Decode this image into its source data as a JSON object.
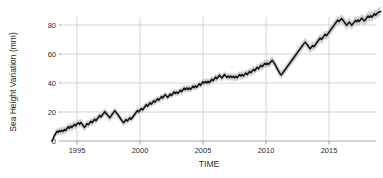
{
  "chart_data": {
    "type": "line",
    "title": "",
    "xlabel": "TIME",
    "ylabel": "Sea Height Variation (mm)",
    "xlim": [
      1992.6,
      11992.6
    ],
    "ylim": [
      -4,
      92
    ],
    "grid": true,
    "legend": false,
    "xticks": [
      1995,
      2000,
      2005,
      2010,
      2015
    ],
    "xtick_labels": [
      "1995",
      "2000",
      "2005",
      "2010",
      "2015"
    ],
    "yticks": [
      0,
      20,
      40,
      60,
      80
    ],
    "ytick_labels": [
      "0",
      "20",
      "40",
      "60",
      "80"
    ],
    "series": [
      {
        "name": "Sea Height Variation",
        "color": "#141414",
        "band_color": "#c9c9c9",
        "x": [
          1993.0,
          1993.1,
          1993.2,
          1993.3,
          1993.4,
          1993.5,
          1993.6,
          1993.7,
          1993.8,
          1993.9,
          1994.0,
          1994.1,
          1994.2,
          1994.3,
          1994.4,
          1994.5,
          1994.6,
          1994.7,
          1994.8,
          1994.9,
          1995.0,
          1995.1,
          1995.2,
          1995.3,
          1995.4,
          1995.5,
          1995.6,
          1995.7,
          1995.8,
          1995.9,
          1996.0,
          1996.1,
          1996.2,
          1996.3,
          1996.4,
          1996.5,
          1996.6,
          1996.7,
          1996.8,
          1996.9,
          1997.0,
          1997.1,
          1997.2,
          1997.3,
          1997.4,
          1997.5,
          1997.6,
          1997.7,
          1997.8,
          1997.9,
          1998.0,
          1998.1,
          1998.2,
          1998.3,
          1998.4,
          1998.5,
          1998.6,
          1998.7,
          1998.8,
          1998.9,
          1999.0,
          1999.1,
          1999.2,
          1999.3,
          1999.4,
          1999.5,
          1999.6,
          1999.7,
          1999.8,
          1999.9,
          2000.0,
          2000.1,
          2000.2,
          2000.3,
          2000.4,
          2000.5,
          2000.6,
          2000.7,
          2000.8,
          2000.9,
          2001.0,
          2001.1,
          2001.2,
          2001.3,
          2001.4,
          2001.5,
          2001.6,
          2001.7,
          2001.8,
          2001.9,
          2002.0,
          2002.1,
          2002.2,
          2002.3,
          2002.4,
          2002.5,
          2002.6,
          2002.7,
          2002.8,
          2002.9,
          2003.0,
          2003.1,
          2003.2,
          2003.3,
          2003.4,
          2003.5,
          2003.6,
          2003.7,
          2003.8,
          2003.9,
          2004.0,
          2004.1,
          2004.2,
          2004.3,
          2004.4,
          2004.5,
          2004.6,
          2004.7,
          2004.8,
          2004.9,
          2005.0,
          2005.1,
          2005.2,
          2005.3,
          2005.4,
          2005.5,
          2005.6,
          2005.7,
          2005.8,
          2005.9,
          2006.0,
          2006.1,
          2006.2,
          2006.3,
          2006.4,
          2006.5,
          2006.6,
          2006.7,
          2006.8,
          2006.9,
          2007.0,
          2007.1,
          2007.2,
          2007.3,
          2007.4,
          2007.5,
          2007.6,
          2007.7,
          2007.8,
          2007.9,
          2008.0,
          2008.1,
          2008.2,
          2008.3,
          2008.4,
          2008.5,
          2008.6,
          2008.7,
          2008.8,
          2008.9,
          2009.0,
          2009.1,
          2009.2,
          2009.3,
          2009.4,
          2009.5,
          2009.6,
          2009.7,
          2009.8,
          2009.9,
          2010.0,
          2010.1,
          2010.2,
          2010.3,
          2010.4,
          2010.5,
          2010.6,
          2010.7,
          2010.8,
          2010.9,
          2011.0,
          2011.1,
          2011.2,
          2011.3,
          2011.4,
          2011.5,
          2011.6,
          2011.7,
          2011.8,
          2011.9,
          2012.0,
          2012.1,
          2012.2,
          2012.3,
          2012.4,
          2012.5,
          2012.6,
          2012.7,
          2012.8,
          2012.9,
          2013.0,
          2013.1,
          2013.2,
          2013.3,
          2013.4,
          2013.5,
          2013.6,
          2013.7,
          2013.8,
          2013.9,
          2014.0,
          2014.1,
          2014.2,
          2014.3,
          2014.4,
          2014.5,
          2014.6,
          2014.7,
          2014.8,
          2014.9,
          2015.0,
          2015.1,
          2015.2,
          2015.3,
          2015.4,
          2015.5,
          2015.6,
          2015.7,
          2015.8,
          2015.9,
          2016.0,
          2016.1,
          2016.2,
          2016.3,
          2016.4,
          2016.5,
          2016.6,
          2016.7,
          2016.8,
          2016.9,
          2017.0,
          2017.1,
          2017.2,
          2017.3,
          2017.4,
          2017.5,
          2017.6,
          2017.7,
          2017.8,
          2017.9,
          2018.0,
          2018.1,
          2018.2,
          2018.3,
          2018.4,
          2018.5,
          2018.6,
          2018.7,
          2018.8,
          2018.9,
          2019.0,
          2019.1
        ],
        "y": [
          0.0,
          1.5,
          3.6,
          5.0,
          6.6,
          6.0,
          7.2,
          6.4,
          7.4,
          6.6,
          8.0,
          7.2,
          8.4,
          9.8,
          8.8,
          10.2,
          9.4,
          10.6,
          11.4,
          10.4,
          11.8,
          12.6,
          11.6,
          12.8,
          11.8,
          10.4,
          9.4,
          10.6,
          12.0,
          11.2,
          12.4,
          13.6,
          12.6,
          13.8,
          15.0,
          14.0,
          15.2,
          16.4,
          17.6,
          16.6,
          17.8,
          19.0,
          20.2,
          19.2,
          18.2,
          17.0,
          16.0,
          17.2,
          18.4,
          19.6,
          20.8,
          19.8,
          18.6,
          17.4,
          16.2,
          14.8,
          13.6,
          12.6,
          13.8,
          14.8,
          13.8,
          14.8,
          16.0,
          15.0,
          16.2,
          17.4,
          18.6,
          19.8,
          21.0,
          20.0,
          21.2,
          22.4,
          21.4,
          22.6,
          23.8,
          25.0,
          24.0,
          25.2,
          26.4,
          25.4,
          26.6,
          27.8,
          26.8,
          28.0,
          29.2,
          28.2,
          29.4,
          30.6,
          29.6,
          30.8,
          32.0,
          31.0,
          30.0,
          31.2,
          32.4,
          31.4,
          32.6,
          33.8,
          32.8,
          33.8,
          32.8,
          33.8,
          35.0,
          34.0,
          35.2,
          36.4,
          35.4,
          36.6,
          35.6,
          36.6,
          35.6,
          36.6,
          37.8,
          36.8,
          38.0,
          37.0,
          38.2,
          39.4,
          38.4,
          39.6,
          40.8,
          40.0,
          41.0,
          40.0,
          41.2,
          40.2,
          41.4,
          42.6,
          41.6,
          42.8,
          44.0,
          43.0,
          44.2,
          45.4,
          44.4,
          43.4,
          44.6,
          45.8,
          44.8,
          43.8,
          44.8,
          43.8,
          44.8,
          43.8,
          44.6,
          43.6,
          44.6,
          43.6,
          44.6,
          45.8,
          44.8,
          45.8,
          44.8,
          45.8,
          46.8,
          45.8,
          46.8,
          48.0,
          47.0,
          48.2,
          49.4,
          48.4,
          49.6,
          50.8,
          49.8,
          51.0,
          52.2,
          51.2,
          52.4,
          53.6,
          52.6,
          53.8,
          52.8,
          53.8,
          54.8,
          55.6,
          54.4,
          53.0,
          51.4,
          49.8,
          48.2,
          46.6,
          45.6,
          46.6,
          47.8,
          49.0,
          50.2,
          51.4,
          52.6,
          53.8,
          55.0,
          56.2,
          57.4,
          58.6,
          59.8,
          61.0,
          62.2,
          63.4,
          64.6,
          65.8,
          67.0,
          68.2,
          67.2,
          66.0,
          64.8,
          63.6,
          64.6,
          65.8,
          65.0,
          66.2,
          67.4,
          68.6,
          69.8,
          71.0,
          70.0,
          71.2,
          72.4,
          73.6,
          72.6,
          73.8,
          75.0,
          76.2,
          77.4,
          78.6,
          79.8,
          81.0,
          82.2,
          83.4,
          82.4,
          83.4,
          84.4,
          83.4,
          82.2,
          81.0,
          79.8,
          80.8,
          82.0,
          81.0,
          79.8,
          80.8,
          82.0,
          83.2,
          82.2,
          83.4,
          82.4,
          83.6,
          84.8,
          83.8,
          82.8,
          83.8,
          85.0,
          86.2,
          85.2,
          86.4,
          85.4,
          86.6,
          87.8,
          86.8,
          87.8,
          88.6,
          89.0,
          89.4
        ],
        "band_half_width": [
          1.2,
          1.6,
          2.0,
          2.2,
          2.4,
          2.4,
          2.5,
          2.5,
          2.6,
          2.6,
          2.6,
          2.6,
          2.6,
          2.6,
          2.6,
          2.6,
          2.6,
          2.6,
          2.6,
          2.6,
          2.6,
          2.6,
          2.6,
          2.6,
          2.6,
          2.6,
          2.6,
          2.6,
          2.6,
          2.6,
          2.5,
          2.5,
          2.5,
          2.5,
          2.5,
          2.5,
          2.5,
          2.5,
          2.5,
          2.5,
          2.5,
          2.5,
          2.5,
          2.5,
          2.5,
          2.5,
          2.5,
          2.5,
          2.5,
          2.5,
          2.5,
          2.5,
          2.5,
          2.5,
          2.5,
          2.5,
          2.5,
          2.5,
          2.5,
          2.5,
          2.4,
          2.4,
          2.4,
          2.4,
          2.4,
          2.4,
          2.4,
          2.4,
          2.4,
          2.4,
          2.4,
          2.4,
          2.4,
          2.4,
          2.4,
          2.4,
          2.4,
          2.4,
          2.4,
          2.4,
          2.3,
          2.3,
          2.3,
          2.3,
          2.3,
          2.3,
          2.3,
          2.3,
          2.3,
          2.3,
          2.3,
          2.3,
          2.3,
          2.3,
          2.3,
          2.3,
          2.3,
          2.3,
          2.3,
          2.3,
          2.3,
          2.3,
          2.3,
          2.3,
          2.3,
          2.3,
          2.3,
          2.3,
          2.3,
          2.3,
          2.3,
          2.3,
          2.3,
          2.3,
          2.3,
          2.3,
          2.3,
          2.3,
          2.3,
          2.3,
          2.4,
          2.4,
          2.4,
          2.4,
          2.4,
          2.4,
          2.4,
          2.4,
          2.4,
          2.4,
          2.5,
          2.5,
          2.5,
          2.5,
          2.5,
          2.5,
          2.5,
          2.5,
          2.5,
          2.5,
          2.5,
          2.5,
          2.5,
          2.5,
          2.5,
          2.5,
          2.5,
          2.5,
          2.5,
          2.5,
          2.6,
          2.6,
          2.6,
          2.6,
          2.6,
          2.6,
          2.6,
          2.6,
          2.6,
          2.6,
          2.7,
          2.7,
          2.7,
          2.7,
          2.7,
          2.7,
          2.7,
          2.7,
          2.7,
          2.7,
          2.8,
          2.8,
          2.8,
          2.8,
          2.8,
          2.8,
          2.8,
          2.8,
          2.8,
          2.8,
          2.8,
          2.8,
          2.8,
          2.8,
          2.8,
          2.8,
          2.8,
          2.8,
          2.8,
          2.8,
          2.9,
          2.9,
          2.9,
          2.9,
          2.9,
          2.9,
          2.9,
          2.9,
          2.9,
          2.9,
          3.0,
          3.0,
          3.0,
          3.0,
          3.0,
          3.0,
          3.0,
          3.0,
          3.0,
          3.0,
          3.0,
          3.0,
          3.0,
          3.0,
          3.0,
          3.0,
          3.0,
          3.0,
          3.0,
          3.0,
          3.1,
          3.1,
          3.1,
          3.1,
          3.1,
          3.1,
          3.1,
          3.1,
          3.1,
          3.1,
          3.1,
          3.1,
          3.1,
          3.1,
          3.1,
          3.1,
          3.1,
          3.1,
          3.1,
          3.1,
          3.2,
          3.2,
          3.2,
          3.2,
          3.2,
          3.2,
          3.2,
          3.2,
          3.2,
          3.2,
          3.2,
          3.2,
          3.2,
          3.2,
          3.2,
          3.2,
          3.2,
          3.2,
          3.2,
          3.2,
          3.2,
          3.2
        ]
      }
    ]
  }
}
